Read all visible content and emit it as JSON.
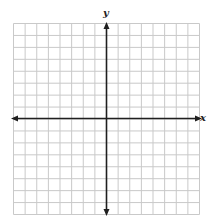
{
  "graph": {
    "type": "coordinate-plane",
    "x_axis_label": "x",
    "y_axis_label": "y",
    "columns": 16,
    "rows": 16,
    "cells_left_of_y_axis": 8,
    "cells_right_of_y_axis": 8,
    "cells_above_x_axis": 8,
    "cells_below_x_axis": 8,
    "x_axis_arrows": [
      "left",
      "right"
    ],
    "y_axis_arrows": [
      "up",
      "down"
    ],
    "tick_labels_shown": false,
    "colors": {
      "grid": "#c9c9c9",
      "axis": "#1f1f1f",
      "background": "#ffffff"
    }
  }
}
